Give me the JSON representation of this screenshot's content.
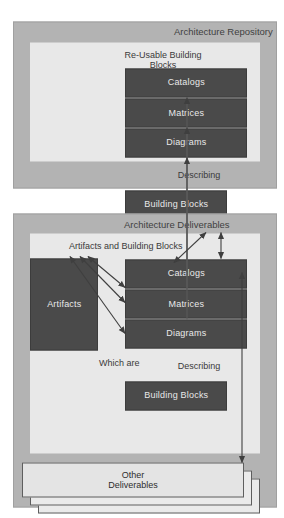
{
  "diagram": {
    "colors": {
      "panel_fill": "#b3b3b3",
      "inner_fill": "#e8e8e8",
      "dark_box": "#4a4a4a",
      "dark_box_text": "#e9e9e9",
      "sheet_fill": "#eaeaea",
      "outline": "#5e5e5e",
      "arrow": "#4a4a4a",
      "background": "#ffffff"
    },
    "panels": [
      {
        "id": "architecture-repository",
        "title": "Architecture Repository",
        "group_label": "Re-Usable Building\nBlocks",
        "describing_label": "Describing",
        "boxes": [
          "Catalogs",
          "Matrices",
          "Diagrams"
        ],
        "side_box": "Building Blocks",
        "stack_label": "Architecture\nDeliverables"
      },
      {
        "id": "architecture-deliverables",
        "title": "Architecture Deliverables",
        "group_label": "Artifacts and Building Blocks",
        "describing_label": "Describing",
        "boxes": [
          "Catalogs",
          "Matrices",
          "Diagrams"
        ],
        "side_box": "Building Blocks",
        "source_box": "Artifacts",
        "relation_label": "Which are",
        "stack_label": "Other Deliverables"
      }
    ],
    "connectors": [
      {
        "name": "catalogs-link",
        "type": "vertical-arrow",
        "from": "Catalogs (deliverables)",
        "to": "Catalogs (repository)"
      },
      {
        "name": "matrices-link",
        "type": "vertical-arrow",
        "from": "Matrices (deliverables)",
        "to": "Matrices (repository)"
      },
      {
        "name": "diagrams-link",
        "type": "vertical-arrow",
        "from": "Diagrams (deliverables)",
        "to": "Diagrams (repository)"
      },
      {
        "name": "artifacts-catalogs-link",
        "type": "double-arrow",
        "from": "Artifacts",
        "to": "Catalogs"
      },
      {
        "name": "artifacts-matrices-link",
        "type": "double-arrow",
        "from": "Artifacts",
        "to": "Matrices"
      },
      {
        "name": "artifacts-diagrams-link",
        "type": "double-arrow",
        "from": "Artifacts",
        "to": "Diagrams"
      },
      {
        "name": "deliverables-inner-link",
        "type": "double-arrow",
        "from": "Architecture Deliverables stack",
        "to": "Architecture Deliverables panel"
      },
      {
        "name": "deliverables-other-link",
        "type": "double-arrow",
        "from": "Architecture Deliverables stack",
        "to": "Other Deliverables stack"
      }
    ]
  }
}
